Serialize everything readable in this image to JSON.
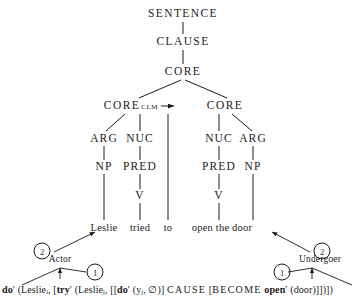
{
  "diagram": {
    "stroke_color": "#1a1a1a",
    "background": "#ffffff"
  },
  "tree": {
    "nodes": [
      {
        "id": "sentence",
        "label": "SENTENCE",
        "x": 183,
        "y": 14
      },
      {
        "id": "clause",
        "label": "CLAUSE",
        "x": 183,
        "y": 42
      },
      {
        "id": "core-top",
        "label": "CORE",
        "x": 183,
        "y": 72
      },
      {
        "id": "core-clm",
        "label": "CORE",
        "sub": "CLM",
        "x": 131,
        "y": 106
      },
      {
        "id": "core-right",
        "label": "CORE",
        "x": 225,
        "y": 106
      },
      {
        "id": "arg-left",
        "label": "ARG",
        "x": 104,
        "y": 139
      },
      {
        "id": "nuc-left",
        "label": "NUC",
        "x": 140,
        "y": 139
      },
      {
        "id": "nuc-right",
        "label": "NUC",
        "x": 219,
        "y": 139
      },
      {
        "id": "arg-right",
        "label": "ARG",
        "x": 253,
        "y": 139
      },
      {
        "id": "np-left",
        "label": "NP",
        "x": 104,
        "y": 167
      },
      {
        "id": "pred-left",
        "label": "PRED",
        "x": 140,
        "y": 167
      },
      {
        "id": "pred-right",
        "label": "PRED",
        "x": 219,
        "y": 167
      },
      {
        "id": "np-right",
        "label": "NP",
        "x": 253,
        "y": 167
      },
      {
        "id": "v-left",
        "label": "V",
        "x": 140,
        "y": 196
      },
      {
        "id": "v-right",
        "label": "V",
        "x": 219,
        "y": 196
      }
    ],
    "words": [
      {
        "id": "word-leslie",
        "label": "Leslie",
        "x": 104,
        "y": 228
      },
      {
        "id": "word-tried",
        "label": "tried",
        "x": 140,
        "y": 228
      },
      {
        "id": "word-to",
        "label": "to",
        "x": 168,
        "y": 228
      },
      {
        "id": "word-open-the-door",
        "label": "open the door",
        "x": 222,
        "y": 228
      }
    ]
  },
  "annotations": {
    "actor_label": "Actor",
    "undergoer_label": "Undergoer",
    "circle_left_outer": "2",
    "circle_left_inner": "1",
    "circle_right_inner": "1",
    "circle_right_outer": "2"
  },
  "logical_structure": {
    "full_text": "do′ (Lesliei, [try′ (Lesliei, [[do′ (yj, ∅)] CAUSE [BECOME open′ (door)]])])",
    "tokens": [
      {
        "t": "do",
        "bold": true
      },
      {
        "t": "′ (Leslie"
      },
      {
        "t": "i",
        "sub": true
      },
      {
        "t": ", ["
      },
      {
        "t": "try",
        "bold": true
      },
      {
        "t": "′ (Leslie"
      },
      {
        "t": "j",
        "sub": true
      },
      {
        "t": ", [["
      },
      {
        "t": "do",
        "bold": true
      },
      {
        "t": "′ (y"
      },
      {
        "t": "j",
        "sub": true
      },
      {
        "t": ", ∅)] "
      },
      {
        "t": "CAUSE",
        "spaced": true
      },
      {
        "t": " ["
      },
      {
        "t": "BECOME",
        "spaced": true
      },
      {
        "t": " "
      },
      {
        "t": "open",
        "bold": true
      },
      {
        "t": "′ (door)]])])"
      }
    ]
  }
}
